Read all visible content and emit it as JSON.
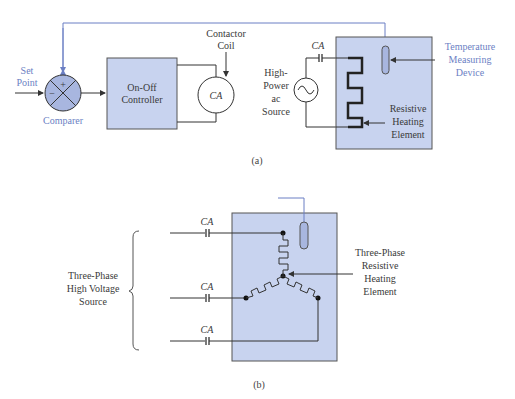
{
  "colors": {
    "box_fill": "#c8d3ef",
    "box_stroke": "#555555",
    "accent_blue": "#6b7fc4",
    "wire": "#333333",
    "label_text": "#3a3a3a"
  },
  "diagram_a": {
    "caption": "(a)",
    "set_point": [
      "Set",
      "Point"
    ],
    "comparer": "Comparer",
    "comparer_plus": "+",
    "comparer_minus": "−",
    "controller": [
      "On-Off",
      "Controller"
    ],
    "contactor_coil": [
      "Contactor",
      "Coil"
    ],
    "coil_label": "CA",
    "contact_label": "CA",
    "source": [
      "High-",
      "Power",
      "ac",
      "Source"
    ],
    "heating_element": [
      "Resistive",
      "Heating",
      "Element"
    ],
    "temp_device": [
      "Temperature",
      "Measuring",
      "Device"
    ]
  },
  "diagram_b": {
    "caption": "(b)",
    "contact_labels": [
      "CA",
      "CA",
      "CA"
    ],
    "source": [
      "Three-Phase",
      "High Voltage",
      "Source"
    ],
    "heating_element": [
      "Three-Phase",
      "Resistive",
      "Heating",
      "Element"
    ]
  }
}
